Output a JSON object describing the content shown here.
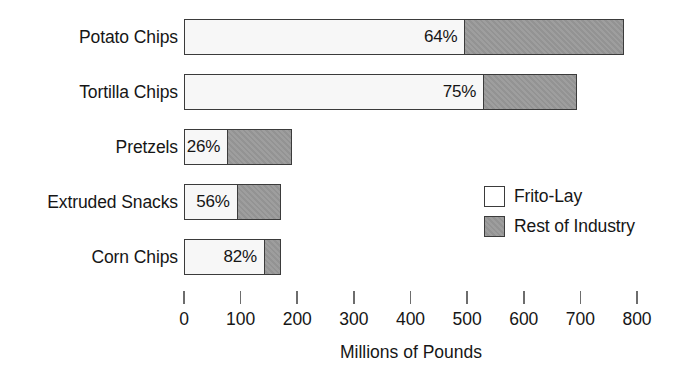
{
  "chart_data": {
    "type": "bar",
    "subtype": "stacked-horizontal",
    "title": "",
    "xlabel": "Millions of Pounds",
    "ylabel": "",
    "xlim": [
      0,
      800
    ],
    "xticks": [
      "0",
      "100",
      "200",
      "300",
      "400",
      "500",
      "600",
      "700",
      "800"
    ],
    "xtick_values": [
      0,
      100,
      200,
      300,
      400,
      500,
      600,
      700,
      800
    ],
    "grid": false,
    "legend_position": "middle-right",
    "categories": [
      "Potato Chips",
      "Tortilla Chips",
      "Pretzels",
      "Extruded Snacks",
      "Corn Chips"
    ],
    "series": [
      {
        "name": "Frito-Lay",
        "color": "#f7f7f7",
        "values": [
          497,
          530,
          78,
          95,
          143
        ],
        "labels": [
          "64%",
          "75%",
          "26%",
          "56%",
          "82%"
        ]
      },
      {
        "name": "Rest of Industry",
        "color": "#989898",
        "values": [
          280,
          164,
          113,
          77,
          28
        ],
        "labels": [
          "",
          "",
          "",
          "",
          ""
        ]
      }
    ],
    "totals": [
      777,
      694,
      191,
      172,
      171
    ]
  },
  "legend": {
    "items": [
      {
        "label": "Frito-Lay",
        "swatch": "brand"
      },
      {
        "label": "Rest of Industry",
        "swatch": "rest"
      }
    ]
  }
}
